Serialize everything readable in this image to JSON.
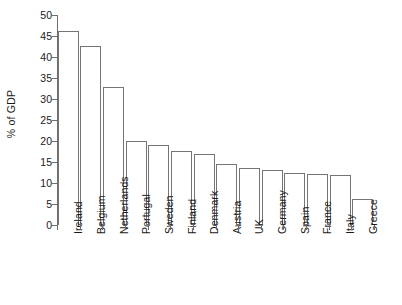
{
  "chart_data": {
    "type": "bar",
    "title": "",
    "subtitle": "",
    "xlabel": "",
    "ylabel": "% of GDP",
    "ylim": [
      0,
      50
    ],
    "ytick_step": 5,
    "yticks": [
      "0",
      "5",
      "10",
      "15",
      "20",
      "25",
      "30",
      "35",
      "40",
      "45",
      "50"
    ],
    "grid": false,
    "legend": null,
    "bar_style": {
      "fill": "#ffffff",
      "edge": "#757575",
      "axis": "#6e6e6e",
      "text": "#1a1a1a"
    },
    "categories": [
      "Ireland",
      "Belgium",
      "Netherlands",
      "Portugal",
      "Sweden",
      "Finland",
      "Denmark",
      "Austria",
      "UK",
      "Germany",
      "Spain",
      "France",
      "Italy",
      "Greece"
    ],
    "values": [
      46.3,
      42.7,
      32.9,
      20.1,
      19.0,
      17.7,
      17.0,
      14.5,
      13.5,
      13.2,
      12.5,
      12.2,
      11.8,
      6.2
    ]
  }
}
